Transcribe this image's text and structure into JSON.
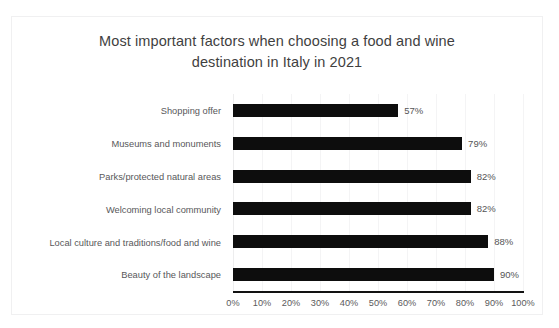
{
  "chart_data": {
    "type": "bar",
    "orientation": "horizontal",
    "title": "Most important factors when choosing a food and wine destination in Italy in 2021",
    "title_lines": [
      "Most important factors when choosing a food and wine",
      "destination in Italy in 2021"
    ],
    "categories": [
      "Shopping offer",
      "Museums and monuments",
      "Parks/protected natural areas",
      "Welcoming local community",
      "Local culture and traditions/food and wine",
      "Beauty of the landscape"
    ],
    "values": [
      57,
      79,
      82,
      82,
      88,
      90
    ],
    "value_labels": [
      "57%",
      "79%",
      "82%",
      "82%",
      "88%",
      "90%"
    ],
    "xlabel": "",
    "ylabel": "",
    "xlim": [
      0,
      100
    ],
    "x_ticks": [
      0,
      10,
      20,
      30,
      40,
      50,
      60,
      70,
      80,
      90,
      100
    ],
    "x_tick_labels": [
      "0%",
      "10%",
      "20%",
      "30%",
      "40%",
      "50%",
      "60%",
      "70%",
      "80%",
      "90%",
      "100%"
    ],
    "grid": true,
    "grid_axis": "x",
    "legend": false,
    "bar_color": "#0d0d0d",
    "title_color": "#3f3f3f",
    "label_color": "#58585a",
    "gridline_color": "#f4f4f5",
    "axis_line_color": "#121212",
    "background_color": "#ffffff",
    "border_color": "#f0f0f1"
  }
}
